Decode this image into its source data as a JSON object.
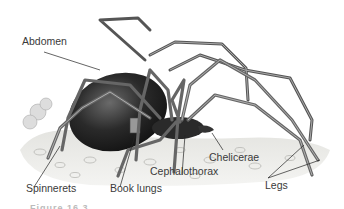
{
  "figure": {
    "labels": {
      "abdomen": "Abdomen",
      "chelicerae": "Chelicerae",
      "cephalothorax": "Cephalothorax",
      "spinnerets": "Spinnerets",
      "book_lungs": "Book lungs",
      "legs": "Legs"
    },
    "caption_partial": "Figure 16.3"
  },
  "colors": {
    "label_text": "#3a3a3a",
    "leader_line": "#222222",
    "body_dark": "#1e1e1e",
    "leg_fill": "#8a8a8a",
    "ground": "#d8d8d4"
  }
}
